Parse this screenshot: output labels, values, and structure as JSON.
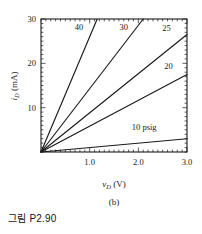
{
  "figure": {
    "subfigure_label": "(b)",
    "caption": "그림 P2.90"
  },
  "chart_data": {
    "type": "line",
    "title": "",
    "xlabel": "v_D (V)",
    "ylabel": "i_D (mA)",
    "xlabel_parts": {
      "italic": "v",
      "sub": "D",
      "unit": "(V)"
    },
    "ylabel_parts": {
      "italic": "i",
      "sub": "D",
      "unit": "(mA)"
    },
    "xlim": [
      0,
      3.0
    ],
    "ylim": [
      0,
      30
    ],
    "xticks": [
      1.0,
      2.0,
      3.0
    ],
    "xticklabels": [
      "1.0",
      "2.0",
      "3.0"
    ],
    "yticks": [
      10,
      20,
      30
    ],
    "yticklabels": [
      "10",
      "20",
      "30"
    ],
    "x_minor_step": 0.1,
    "y_minor_step": 1,
    "grid": false,
    "legend_position": "inline-curve-labels",
    "frame": "box-all-sides-inward-ticks",
    "series": [
      {
        "name": "40",
        "label": "40",
        "slope_mA_per_V": 26.0,
        "x": [
          0,
          1.15
        ],
        "values": [
          0,
          29.9
        ],
        "label_x": 0.78,
        "label_y": 28.2
      },
      {
        "name": "30",
        "label": "30",
        "slope_mA_per_V": 14.3,
        "x": [
          0,
          2.1
        ],
        "values": [
          0,
          30.0
        ],
        "label_x": 1.7,
        "label_y": 28.2
      },
      {
        "name": "25",
        "label": "25",
        "slope_mA_per_V": 8.83,
        "x": [
          0,
          3.0
        ],
        "values": [
          0,
          26.5
        ],
        "label_x": 2.58,
        "label_y": 28.0
      },
      {
        "name": "20",
        "label": "20",
        "slope_mA_per_V": 5.83,
        "x": [
          0,
          3.0
        ],
        "values": [
          0,
          17.5
        ],
        "label_x": 2.62,
        "label_y": 19.4
      },
      {
        "name": "10 psig",
        "label": "10 psig",
        "slope_mA_per_V": 1.0,
        "x": [
          0,
          3.0
        ],
        "values": [
          0,
          3.0
        ],
        "label_x": 2.12,
        "label_y": 5.6
      }
    ]
  }
}
